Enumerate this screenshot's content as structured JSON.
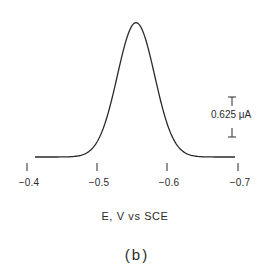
{
  "chart_data": {
    "type": "line",
    "title": "",
    "caption": "(b)",
    "xlabel": "E, V vs SCE",
    "ylabel": "",
    "x_ticks": [
      "-0.4",
      "-0.5",
      "-0.6",
      "-0.7"
    ],
    "x_tick_values": [
      -0.4,
      -0.5,
      -0.6,
      -0.7
    ],
    "xlim": [
      -0.4,
      -0.7
    ],
    "grid": false,
    "legend": null,
    "scale_bar": {
      "label": "0.625 μA",
      "value": 0.625,
      "unit": "μA"
    },
    "series": [
      {
        "name": "voltammetric peak",
        "peak_potential_V": -0.555,
        "peak_height_uA": 2.1,
        "x": [
          -0.41,
          -0.43,
          -0.45,
          -0.47,
          -0.49,
          -0.5,
          -0.51,
          -0.52,
          -0.53,
          -0.54,
          -0.55,
          -0.555,
          -0.56,
          -0.57,
          -0.58,
          -0.59,
          -0.6,
          -0.61,
          -0.62,
          -0.64,
          -0.66,
          -0.69
        ],
        "y": [
          0.0,
          0.0,
          0.01,
          0.03,
          0.09,
          0.16,
          0.3,
          0.55,
          0.95,
          1.45,
          1.95,
          2.1,
          2.05,
          1.7,
          1.15,
          0.65,
          0.32,
          0.13,
          0.05,
          0.01,
          0.0,
          0.0
        ]
      }
    ]
  },
  "axis": {
    "ticks": [
      {
        "label": "−0.4",
        "x": 27
      },
      {
        "label": "−0.5",
        "x": 97
      },
      {
        "label": "−0.6",
        "x": 167
      },
      {
        "label": "−0.7",
        "x": 238
      }
    ],
    "xlabel": "E, V vs SCE"
  },
  "scale_bar": {
    "label": "0.625 μA"
  },
  "caption": "(b)",
  "colors": {
    "line": "#2a2a2a",
    "background": "#ffffff"
  }
}
